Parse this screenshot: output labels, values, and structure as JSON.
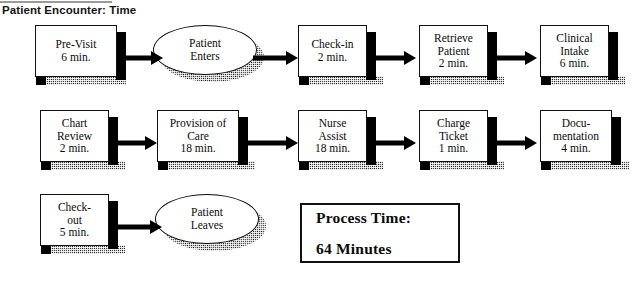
{
  "header": {
    "title": "Patient Encounter: Time",
    "rule_icon": "horizontal-rule"
  },
  "flow": {
    "rows": [
      {
        "id": "row-1",
        "nodes": [
          {
            "type": "process",
            "name": "pre-visit",
            "lines": [
              "Pre-Visit",
              "6 min."
            ],
            "duration": "6 min."
          },
          {
            "type": "terminator",
            "name": "patient-enters",
            "lines": [
              "Patient",
              "Enters"
            ],
            "duration": ""
          },
          {
            "type": "process",
            "name": "check-in",
            "lines": [
              "Check-in",
              "2 min."
            ],
            "duration": "2 min."
          },
          {
            "type": "process",
            "name": "retrieve-patient",
            "lines": [
              "Retrieve",
              "Patient",
              "2 min."
            ],
            "duration": "2 min."
          },
          {
            "type": "process",
            "name": "clinical-intake",
            "lines": [
              "Clinical",
              "Intake",
              "6 min."
            ],
            "duration": "6 min."
          }
        ]
      },
      {
        "id": "row-2",
        "nodes": [
          {
            "type": "process",
            "name": "chart-review",
            "lines": [
              "Chart",
              "Review",
              "2 min."
            ],
            "duration": "2 min."
          },
          {
            "type": "process",
            "name": "provision-of-care",
            "lines": [
              "Provision of",
              "Care",
              "18 min."
            ],
            "duration": "18 min."
          },
          {
            "type": "process",
            "name": "nurse-assist",
            "lines": [
              "Nurse",
              "Assist",
              "18 min."
            ],
            "duration": "18 min."
          },
          {
            "type": "process",
            "name": "charge-ticket",
            "lines": [
              "Charge",
              "Ticket",
              "1 min."
            ],
            "duration": "1 min."
          },
          {
            "type": "process",
            "name": "documentation",
            "lines": [
              "Docu-",
              "mentation",
              "4 min."
            ],
            "duration": "4 min."
          }
        ]
      },
      {
        "id": "row-3",
        "nodes": [
          {
            "type": "process",
            "name": "check-out",
            "lines": [
              "Check-",
              "out",
              "5 min."
            ],
            "duration": "5 min."
          },
          {
            "type": "terminator",
            "name": "patient-leaves",
            "lines": [
              "Patient",
              "Leaves"
            ],
            "duration": ""
          }
        ]
      }
    ],
    "arrow_icon": "arrow-right-icon"
  },
  "summary": {
    "label": "Process Time:",
    "value": "64 Minutes"
  },
  "colors": {
    "ink": "#111111",
    "paper": "#ffffff",
    "shadow": "#4a4a4a"
  }
}
